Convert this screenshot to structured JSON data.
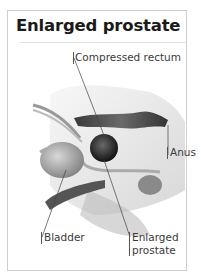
{
  "title": "Enlarged prostate",
  "labels": {
    "compressed_rectum": "Compressed rectum",
    "anus": "Anus",
    "bladder": "Bladder",
    "enlarged_prostate_line1": "Enlarged",
    "enlarged_prostate_line2": "prostate"
  },
  "colors": {
    "border": "#cfcfcf",
    "title": "#1a1a1a",
    "label": "#3a3a3a"
  }
}
